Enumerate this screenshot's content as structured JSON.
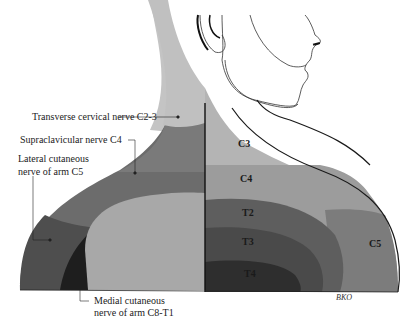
{
  "diagram": {
    "colors": {
      "c3": "#b4b4b4",
      "c4": "#9c9c9c",
      "c2_3_nerve": "#7a7a7a",
      "supraclavicular": "#6c6c6c",
      "c5": "#7c7c7c",
      "lateral_c5": "#4e4e4e",
      "medial_c8_t1": "#1e1e1e",
      "arm_inner": "#a8a8a8",
      "t2": "#5e5e5e",
      "t3": "#4a4a4a",
      "t4": "#2e2e2e",
      "neck_upper": "#c4c4c4"
    },
    "left_labels": [
      {
        "text": "Transverse cervical nerve C2-3"
      },
      {
        "text": "Supraclavicular nerve C4"
      },
      {
        "line1": "Lateral cutaneous",
        "line2": "nerve of arm C5"
      },
      {
        "line1": "Medial cutaneous",
        "line2": "nerve of arm C8-T1"
      }
    ],
    "dermatomes": [
      "C3",
      "C4",
      "T2",
      "T3",
      "T4",
      "C5"
    ],
    "signature": "BKO"
  }
}
